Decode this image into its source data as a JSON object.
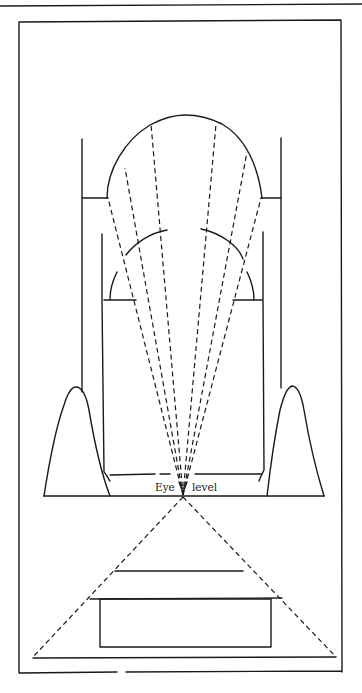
{
  "figure": {
    "type": "perspective sight-line diagram",
    "labels": {
      "eye_left": "Eye",
      "eye_right": "level"
    },
    "colors": {
      "ink": "#1a1a1a",
      "background": "#ffffff"
    },
    "components": [
      "top-rule",
      "outer-frame",
      "dome-elevation",
      "outer-walls",
      "inner-walls",
      "inner-arches",
      "side-hills",
      "ground-line",
      "sight-lines",
      "plan-view-triangle",
      "plan-view-building"
    ]
  }
}
